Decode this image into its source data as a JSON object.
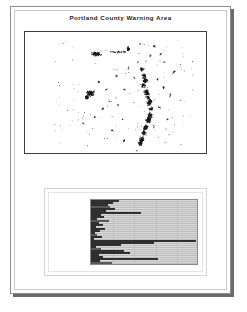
{
  "document": {
    "title": "Portland County Warning Area"
  },
  "map": {
    "name": "portland-county-warning-area-map",
    "background_color": "#ffffff",
    "point_color": "#1a1a1a",
    "border_color": "#3d3d3d",
    "description": "Scattered dark point clusters forming a north-south corridor with an isolated western cluster"
  },
  "chart_panel": {
    "footnote": "",
    "background_color": "#fdfdfd"
  },
  "chart_data": {
    "type": "bar",
    "orientation": "horizontal",
    "title": "",
    "xlabel": "",
    "ylabel": "",
    "xlim": [
      0,
      100
    ],
    "grid": true,
    "legend": null,
    "plot_background": "#d9d9d9",
    "bar_color": "#2f2f2f",
    "categories": [
      "",
      "",
      "",
      "",
      "",
      "",
      "",
      "",
      "",
      "",
      "",
      "",
      "",
      "",
      "",
      "",
      "",
      "",
      "",
      "",
      "",
      "",
      "",
      "",
      "",
      "",
      "",
      "",
      "",
      "",
      "",
      "",
      ""
    ],
    "values": [
      26,
      20,
      16,
      18,
      22,
      14,
      46,
      9,
      12,
      6,
      17,
      7,
      11,
      5,
      13,
      8,
      4,
      6,
      10,
      3,
      97,
      58,
      28,
      5,
      9,
      31,
      36,
      7,
      11,
      62,
      8,
      19,
      33
    ],
    "xticks": [
      "",
      "",
      "",
      ""
    ]
  }
}
